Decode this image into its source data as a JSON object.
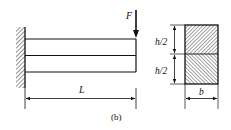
{
  "figure": {
    "caption": "(b)"
  },
  "beam": {
    "load_label": "F",
    "length_label": "L"
  },
  "cross_section": {
    "top_height_label": "h/2",
    "bottom_height_label": "h/2",
    "width_label": "b"
  },
  "colors": {
    "line": "#111111",
    "background": "#ffffff"
  }
}
